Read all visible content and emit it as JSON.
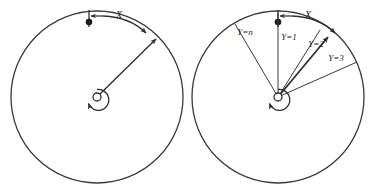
{
  "figure": {
    "title": "",
    "background_color": "#ffffff",
    "stroke_color": "#3a3a3a",
    "text_color": "#222222",
    "width": 370,
    "height": 188
  },
  "panels": [
    {
      "id": "left-panel",
      "name": "single-radius-circle",
      "circle": {
        "cx": 97,
        "cy": 97,
        "r": 86
      },
      "hub": {
        "cx": 97,
        "cy": 97,
        "r": 4
      },
      "marker_dot": {
        "cx": 89,
        "cy": 22,
        "r": 3.2
      },
      "tick_mark": {
        "x": 89,
        "y_top": 10,
        "y_bottom": 27
      },
      "arc_arrow_label": "X",
      "arc_arrow_label_pos": {
        "x": 118,
        "y": 17
      },
      "rotation_arrow": "counterclockwise",
      "radii": [
        {
          "label": "",
          "angle_deg": 42,
          "arrowhead": true
        }
      ]
    },
    {
      "id": "right-panel",
      "name": "multi-radius-circle",
      "circle": {
        "cx": 278,
        "cy": 97,
        "r": 86
      },
      "hub": {
        "cx": 278,
        "cy": 97,
        "r": 4
      },
      "marker_dot": {
        "cx": 278,
        "cy": 22,
        "r": 3.2
      },
      "tick_mark": {
        "x": 278,
        "y_top": 10,
        "y_bottom": 27
      },
      "arc_arrow_label": "X",
      "arc_arrow_label_pos": {
        "x": 307,
        "y": 17
      },
      "rotation_arrow": "counterclockwise",
      "radii": [
        {
          "label": "Y=n",
          "angle_deg": 105,
          "arrowhead": false,
          "label_pos": {
            "x": 228,
            "y": 33
          }
        },
        {
          "label": "Y=1",
          "angle_deg": 90,
          "arrowhead": false,
          "label_pos": {
            "x": 258,
            "y": 40
          }
        },
        {
          "label": "Y=2",
          "angle_deg": 55,
          "arrowhead": true,
          "label_pos": {
            "x": 288,
            "y": 50
          }
        },
        {
          "label": "Y=3",
          "angle_deg": 27,
          "arrowhead": false,
          "label_pos": {
            "x": 305,
            "y": 62
          }
        }
      ]
    }
  ],
  "labels": {
    "x_left": "X",
    "x_right": "X",
    "y_n": "Y=n",
    "y_1": "Y=1",
    "y_2": "Y=2",
    "y_3": "Y=3"
  }
}
